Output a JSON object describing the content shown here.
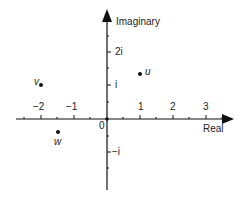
{
  "diagram": {
    "axes": {
      "x_label": "Real",
      "y_label": "Imaginary",
      "origin_label": "0",
      "x_ticks": [
        "−2",
        "−1",
        "1",
        "2",
        "3"
      ],
      "y_ticks": [
        "2i",
        "i",
        "−i"
      ]
    },
    "points": [
      {
        "name": "v",
        "re": -2,
        "im": 1
      },
      {
        "name": "u",
        "re": 1,
        "im": 1.33
      },
      {
        "name": "w",
        "re": -1.5,
        "im": -0.4
      }
    ],
    "colors": {
      "ink": "#111111",
      "background": "#ffffff"
    }
  }
}
